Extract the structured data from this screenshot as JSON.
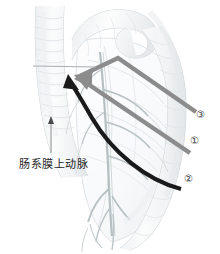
{
  "figure": {
    "background_color": "#ffffff"
  },
  "labels": {
    "artery": {
      "text": "肠系膜上动脉",
      "color": "#1c1c1c"
    },
    "markers": [
      {
        "id": "marker-3",
        "text": "③",
        "color": "#3a3a3a"
      },
      {
        "id": "marker-1",
        "text": "①",
        "color": "#3a3a3a"
      },
      {
        "id": "marker-2",
        "text": "②",
        "color": "#3a3a3a"
      }
    ]
  },
  "arrows": {
    "approach_3": {
      "name": "approach-arrow-3",
      "color": "#8c8c8c",
      "stroke_width": 4.5,
      "description": "gray bent arrow from lower right, peaking top center, pointing left to target"
    },
    "approach_1": {
      "name": "approach-arrow-1",
      "color": "#8c8c8c",
      "stroke_width": 4.5,
      "description": "gray straight arrow from lower right pointing up-left to target"
    },
    "approach_2": {
      "name": "approach-arrow-2",
      "color": "#1a1a1a",
      "stroke_width": 4.0,
      "description": "black curved arrow sweeping from lower right up to target"
    },
    "pointer": {
      "name": "artery-pointer-line",
      "color": "#8a8a8a",
      "stroke_width": 1,
      "description": "thin vertical leader line with small arrowhead pointing up from the label"
    }
  },
  "anatomy": {
    "outline_color": "#c9cdd0",
    "vessel_color": "#b6bfc2",
    "shadow_color": "#e4e7e9",
    "parts": [
      "duodenum",
      "jejunum-loop",
      "mesentery",
      "superior-mesenteric-artery",
      "mesenteric-vessels"
    ]
  }
}
